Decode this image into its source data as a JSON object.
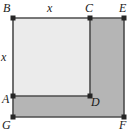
{
  "figure": {
    "colors": {
      "outer_fill": "#b5b5b5",
      "inner_fill": "#ebebeb",
      "stroke": "#4d4d4d",
      "vertex": "#262626",
      "text": "#1a1a1a",
      "background": "#ffffff"
    },
    "vertex_labels": {
      "B": "B",
      "C": "C",
      "E": "E",
      "A": "A",
      "D": "D",
      "G": "G",
      "F": "F"
    },
    "side_labels": {
      "top": "x",
      "left": "x"
    },
    "points": {
      "B": [
        13,
        18
      ],
      "C": [
        90,
        18
      ],
      "E": [
        124,
        18
      ],
      "A": [
        13,
        96
      ],
      "D": [
        90,
        96
      ],
      "G": [
        13,
        117
      ],
      "F": [
        124,
        117
      ]
    }
  }
}
